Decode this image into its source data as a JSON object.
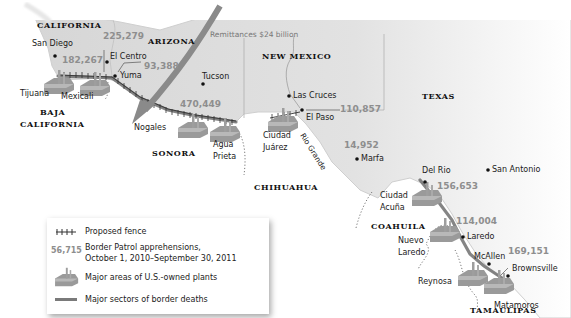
{
  "map": {
    "states_us": [
      {
        "id": "california",
        "label": "CALIFORNIA",
        "x": 37,
        "y": 21
      },
      {
        "id": "arizona",
        "label": "ARIZONA",
        "x": 148,
        "y": 37
      },
      {
        "id": "new-mexico",
        "label": "NEW MEXICO",
        "x": 262,
        "y": 52
      },
      {
        "id": "texas",
        "label": "TEXAS",
        "x": 422,
        "y": 92
      }
    ],
    "states_mx": [
      {
        "id": "baja-california-1",
        "label": "BAJA",
        "x": 40,
        "y": 108
      },
      {
        "id": "baja-california-2",
        "label": "CALIFORNIA",
        "x": 20,
        "y": 120
      },
      {
        "id": "sonora",
        "label": "SONORA",
        "x": 152,
        "y": 149
      },
      {
        "id": "chihuahua",
        "label": "CHIHUAHUA",
        "x": 254,
        "y": 183
      },
      {
        "id": "coahuila",
        "label": "COAHUILA",
        "x": 371,
        "y": 222
      },
      {
        "id": "tamaulipas",
        "label": "TAMAULIPAS",
        "x": 470,
        "y": 318
      }
    ],
    "cities": [
      {
        "id": "san-diego",
        "label": "San Diego",
        "x": 32,
        "y": 40,
        "dot": [
          55,
          56
        ]
      },
      {
        "id": "el-centro",
        "label": "El Centro",
        "x": 108,
        "y": 53,
        "dot": [
          107,
          62
        ]
      },
      {
        "id": "yuma",
        "label": "Yuma",
        "x": 120,
        "y": 72,
        "dot": [
          115,
          76
        ]
      },
      {
        "id": "tijuana",
        "label": "Tijuana",
        "x": 20,
        "y": 90,
        "dot": null
      },
      {
        "id": "mexicali",
        "label": "Mexicali",
        "x": 61,
        "y": 93,
        "dot": null
      },
      {
        "id": "tucson",
        "label": "Tucson",
        "x": 202,
        "y": 73,
        "dot": [
          203,
          84
        ]
      },
      {
        "id": "nogales",
        "label": "Nogales",
        "x": 134,
        "y": 124,
        "dot": null
      },
      {
        "id": "agua-prieta-1",
        "label": "Agua",
        "x": 213,
        "y": 141,
        "dot": null
      },
      {
        "id": "agua-prieta-2",
        "label": "Prieta",
        "x": 213,
        "y": 153,
        "dot": null
      },
      {
        "id": "las-cruces",
        "label": "Las Cruces",
        "x": 293,
        "y": 92,
        "dot": [
          289,
          96
        ]
      },
      {
        "id": "el-paso",
        "label": "El Paso",
        "x": 306,
        "y": 114,
        "dot": [
          302,
          110
        ]
      },
      {
        "id": "ciudad-juarez-1",
        "label": "Ciudad",
        "x": 263,
        "y": 132,
        "dot": null
      },
      {
        "id": "ciudad-juarez-2",
        "label": "Juárez",
        "x": 263,
        "y": 144,
        "dot": null
      },
      {
        "id": "marfa",
        "label": "Marfa",
        "x": 361,
        "y": 155,
        "dot": [
          357,
          159
        ]
      },
      {
        "id": "del-rio",
        "label": "Del Rio",
        "x": 422,
        "y": 167,
        "dot": [
          425,
          182
        ]
      },
      {
        "id": "san-antonio",
        "label": "San Antonio",
        "x": 492,
        "y": 166,
        "dot": [
          488,
          170
        ]
      },
      {
        "id": "ciudad-acuna-1",
        "label": "Ciudad",
        "x": 380,
        "y": 192,
        "dot": null
      },
      {
        "id": "ciudad-acuna-2",
        "label": "Acuña",
        "x": 380,
        "y": 204,
        "dot": null
      },
      {
        "id": "laredo",
        "label": "Laredo",
        "x": 467,
        "y": 233,
        "dot": [
          463,
          237
        ]
      },
      {
        "id": "nuevo-laredo-1",
        "label": "Nuevo",
        "x": 398,
        "y": 237,
        "dot": null
      },
      {
        "id": "nuevo-laredo-2",
        "label": "Laredo",
        "x": 398,
        "y": 249,
        "dot": null
      },
      {
        "id": "mcallen",
        "label": "McAllen",
        "x": 474,
        "y": 253,
        "dot": [
          489,
          264
        ]
      },
      {
        "id": "brownsville",
        "label": "Brownsville",
        "x": 512,
        "y": 265,
        "dot": [
          508,
          276
        ]
      },
      {
        "id": "reynosa",
        "label": "Reynosa",
        "x": 418,
        "y": 278,
        "dot": null
      },
      {
        "id": "matamoros",
        "label": "Matamoros",
        "x": 494,
        "y": 302,
        "dot": null
      }
    ],
    "apprehensions": [
      {
        "id": "san-diego-sector",
        "value": "182,267",
        "x": 62,
        "y": 56
      },
      {
        "id": "el-centro-sector",
        "value": "225,279",
        "x": 103,
        "y": 32
      },
      {
        "id": "yuma-sector",
        "value": "93,388",
        "x": 144,
        "y": 62
      },
      {
        "id": "tucson-sector",
        "value": "470,449",
        "x": 180,
        "y": 100
      },
      {
        "id": "el-paso-sector",
        "value": "110,857",
        "x": 340,
        "y": 105
      },
      {
        "id": "marfa-sector",
        "value": "14,952",
        "x": 344,
        "y": 141
      },
      {
        "id": "del-rio-sector",
        "value": "156,653",
        "x": 437,
        "y": 182
      },
      {
        "id": "laredo-sector",
        "value": "114,004",
        "x": 456,
        "y": 217
      },
      {
        "id": "rio-grande-valley-sector",
        "value": "169,151",
        "x": 508,
        "y": 247
      }
    ],
    "remittances": {
      "label": "Remittances $24 billion",
      "x": 210,
      "y": 31
    },
    "river": {
      "label": "Rio Grande",
      "x": 305,
      "y": 132
    }
  },
  "legend": {
    "items": [
      {
        "id": "proposed-fence",
        "symbol": "fence",
        "label": "Proposed fence"
      },
      {
        "id": "apprehensions",
        "symbol_text": "56,715",
        "label_line1": "Border Patrol apprehensions,",
        "label_line2": "October 1, 2010–September 30, 2011"
      },
      {
        "id": "us-plants",
        "symbol": "plant",
        "label": "Major areas of U.S.-owned plants"
      },
      {
        "id": "border-deaths",
        "symbol": "gray-bar",
        "label": "Major sectors of border deaths"
      }
    ]
  },
  "colors": {
    "us_fill": "#dcdcdc",
    "mexico_fill": "#ffffff",
    "numbers": "#8e8e8e",
    "deaths_sector": "#6d6d6d",
    "arrow": "#8a8a8a"
  }
}
